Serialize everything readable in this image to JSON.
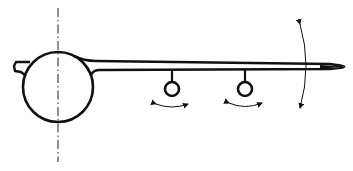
{
  "diagram": {
    "title": "",
    "colors": {
      "stroke": "#111111",
      "background": "#ffffff"
    },
    "elements": {
      "centerline": {
        "type": "dash-dot",
        "x": 58,
        "y1": 8,
        "y2": 162
      },
      "hub": {
        "type": "circle",
        "cx": 58,
        "cy": 87,
        "r": 35
      },
      "stub": {
        "type": "small-tab",
        "side": "left"
      },
      "beam": {
        "type": "tapered-beam",
        "x_start": 90,
        "x_tip": 345
      },
      "pendulums": [
        {
          "id": "pendulum-1",
          "x": 172,
          "bob_cy": 89,
          "bob_r": 7
        },
        {
          "id": "pendulum-2",
          "x": 242,
          "bob_cy": 89,
          "bob_r": 7
        }
      ],
      "swing_arrows": [
        {
          "id": "swing-arrow-1",
          "x": 172
        },
        {
          "id": "swing-arrow-2",
          "x": 242
        }
      ],
      "tip_arc": {
        "type": "double-headed-arc",
        "x": 300,
        "y1": 24,
        "y2": 108
      }
    },
    "labels": []
  }
}
